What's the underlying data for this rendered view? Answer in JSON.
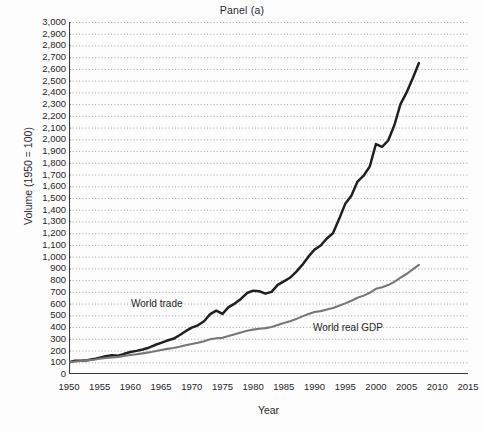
{
  "figure": {
    "title": "Panel (a)",
    "x_axis_title": "Year",
    "y_axis_title": "Volume (1950 = 100)"
  },
  "labels": {
    "world_trade": "World trade",
    "world_real_gdp": "World real GDP"
  },
  "colors": {
    "world_trade": "#231f20",
    "world_real_gdp": "#77777a",
    "grid": "#9a9a9a",
    "axis": "#3a3a3a",
    "background": "#fdfdfd"
  },
  "chart_data": {
    "type": "line",
    "title": "Panel (a)",
    "xlabel": "Year",
    "ylabel": "Volume (1950 = 100)",
    "xlim": [
      1950,
      2015
    ],
    "ylim": [
      0,
      3000
    ],
    "xticks": [
      1950,
      1955,
      1960,
      1965,
      1970,
      1975,
      1980,
      1985,
      1990,
      1995,
      2000,
      2005,
      2010,
      2015
    ],
    "yticks": [
      0,
      100,
      200,
      300,
      400,
      500,
      600,
      700,
      800,
      900,
      1000,
      1100,
      1200,
      1300,
      1400,
      1500,
      1600,
      1700,
      1800,
      1900,
      2000,
      2100,
      2200,
      2300,
      2400,
      2500,
      2600,
      2700,
      2800,
      2900,
      3000
    ],
    "ytick_labels": [
      "0",
      "100",
      "200",
      "300",
      "400",
      "500",
      "600",
      "700",
      "800",
      "900",
      "1,000",
      "1,100",
      "1,200",
      "1,300",
      "1,400",
      "1,500",
      "1,600",
      "1,700",
      "1,800",
      "1,900",
      "2,000",
      "2,100",
      "2,200",
      "2,300",
      "2,400",
      "2,500",
      "2,600",
      "2,700",
      "2,800",
      "2,900",
      "3,000"
    ],
    "xtick_labels": [
      "1950",
      "1955",
      "1960",
      "1965",
      "1970",
      "1975",
      "1980",
      "1985",
      "1990",
      "1995",
      "2000",
      "2005",
      "2010",
      "2015"
    ],
    "grid": "horizontal-dotted",
    "legend": "inline-annotations",
    "series": [
      {
        "name": "World trade",
        "color": "#231f20",
        "x": [
          1950,
          1951,
          1952,
          1953,
          1954,
          1955,
          1956,
          1957,
          1958,
          1959,
          1960,
          1961,
          1962,
          1963,
          1964,
          1965,
          1966,
          1967,
          1968,
          1969,
          1970,
          1971,
          1972,
          1973,
          1974,
          1975,
          1976,
          1977,
          1978,
          1979,
          1980,
          1981,
          1982,
          1983,
          1984,
          1985,
          1986,
          1987,
          1988,
          1989,
          1990,
          1991,
          1992,
          1993,
          1994,
          1995,
          1996,
          1997,
          1998,
          1999,
          2000,
          2001,
          2002,
          2003,
          2004,
          2005,
          2006,
          2007
        ],
        "values": [
          100,
          113,
          112,
          118,
          127,
          139,
          152,
          160,
          155,
          172,
          187,
          197,
          209,
          224,
          247,
          265,
          285,
          300,
          330,
          365,
          395,
          415,
          450,
          510,
          540,
          512,
          570,
          600,
          640,
          690,
          710,
          705,
          685,
          700,
          760,
          790,
          820,
          870,
          930,
          1000,
          1060,
          1095,
          1155,
          1200,
          1320,
          1450,
          1520,
          1640,
          1690,
          1770,
          1960,
          1935,
          1990,
          2120,
          2300,
          2400,
          2520,
          2650
        ]
      },
      {
        "name": "World real GDP",
        "color": "#77777a",
        "x": [
          1950,
          1951,
          1952,
          1953,
          1954,
          1955,
          1956,
          1957,
          1958,
          1959,
          1960,
          1961,
          1962,
          1963,
          1964,
          1965,
          1966,
          1967,
          1968,
          1969,
          1970,
          1971,
          1972,
          1973,
          1974,
          1975,
          1976,
          1977,
          1978,
          1979,
          1980,
          1981,
          1982,
          1983,
          1984,
          1985,
          1986,
          1987,
          1988,
          1989,
          1990,
          1991,
          1992,
          1993,
          1994,
          1995,
          1996,
          1997,
          1998,
          1999,
          2000,
          2001,
          2002,
          2003,
          2004,
          2005,
          2006,
          2007
        ],
        "values": [
          100,
          106,
          111,
          117,
          122,
          130,
          136,
          142,
          146,
          153,
          162,
          168,
          176,
          184,
          194,
          204,
          214,
          222,
          233,
          245,
          256,
          266,
          280,
          296,
          305,
          308,
          324,
          338,
          353,
          368,
          378,
          386,
          391,
          401,
          418,
          435,
          450,
          468,
          491,
          512,
          528,
          536,
          549,
          562,
          582,
          602,
          624,
          650,
          668,
          692,
          726,
          740,
          758,
          785,
          822,
          852,
          892,
          930
        ]
      }
    ]
  }
}
